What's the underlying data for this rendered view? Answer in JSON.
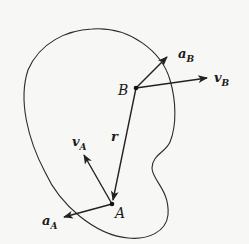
{
  "figure": {
    "colors": {
      "stroke": "#222222",
      "background": "#f7f7f5"
    },
    "points": {
      "A": {
        "label": "A",
        "x": 112,
        "y": 204
      },
      "B": {
        "label": "B",
        "x": 136,
        "y": 88
      }
    },
    "vectors": [
      {
        "id": "r",
        "label": "r",
        "from": "B",
        "to": "A"
      },
      {
        "id": "vA",
        "label": "v",
        "sub": "A",
        "from": "A",
        "tip": [
          83,
          153
        ]
      },
      {
        "id": "aA",
        "label": "a",
        "sub": "A",
        "from": "A",
        "tip": [
          62,
          217
        ]
      },
      {
        "id": "vB",
        "label": "v",
        "sub": "B",
        "from": "B",
        "tip": [
          208,
          77
        ]
      },
      {
        "id": "aB",
        "label": "a",
        "sub": "B",
        "from": "B",
        "tip": [
          168,
          56
        ]
      }
    ]
  },
  "labels": {
    "A": "A",
    "B": "B",
    "r": "r",
    "vA_main": "v",
    "vA_sub": "A",
    "aA_main": "a",
    "aA_sub": "A",
    "vB_main": "v",
    "vB_sub": "B",
    "aB_main": "a",
    "aB_sub": "B"
  }
}
